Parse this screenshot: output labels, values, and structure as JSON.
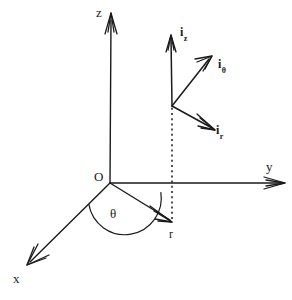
{
  "figure": {
    "kind": "cylindrical-coordinate-system-diagram",
    "background_color": "#ffffff",
    "ink_color": "#1a1a1a",
    "width": 292,
    "height": 300
  },
  "axes": {
    "z": {
      "label": "z",
      "label_x": 96,
      "label_y": 6,
      "from": [
        110,
        183
      ],
      "to": [
        111,
        18
      ]
    },
    "y": {
      "label": "y",
      "label_x": 266,
      "label_y": 160,
      "from": [
        110,
        183
      ],
      "to": [
        284,
        183
      ]
    },
    "x": {
      "label": "x",
      "label_x": 13,
      "label_y": 272,
      "from": [
        110,
        183
      ],
      "to": [
        28,
        264
      ]
    }
  },
  "origin": {
    "label": "O",
    "label_x": 94,
    "label_y": 170,
    "point": [
      110,
      183
    ]
  },
  "radial": {
    "label": "r",
    "label_x": 169,
    "label_y": 228,
    "from": [
      110,
      183
    ],
    "to": [
      172,
      222
    ]
  },
  "angle": {
    "label": "θ",
    "label_x": 110,
    "label_y": 207,
    "arc_radius": 30,
    "between": [
      "x-axis",
      "r-vector"
    ]
  },
  "projection": {
    "name": "dotted-projection-line",
    "from": [
      172,
      220
    ],
    "to": [
      172,
      107
    ]
  },
  "unit_vectors": {
    "base_point": [
      172,
      106
    ],
    "items": [
      {
        "name": "i-z",
        "symbol": "i",
        "subscript": "z",
        "label_x": 180,
        "label_y": 26,
        "from": [
          172,
          106
        ],
        "to": [
          171,
          36
        ],
        "direction": "up"
      },
      {
        "name": "i-theta",
        "symbol": "i",
        "subscript": "θ",
        "label_x": 218,
        "label_y": 58,
        "from": [
          172,
          106
        ],
        "to": [
          211,
          57
        ],
        "direction": "up-right"
      },
      {
        "name": "i-r",
        "symbol": "i",
        "subscript": "r",
        "label_x": 216,
        "label_y": 124,
        "from": [
          172,
          106
        ],
        "to": [
          214,
          130
        ],
        "direction": "down-right"
      }
    ]
  }
}
